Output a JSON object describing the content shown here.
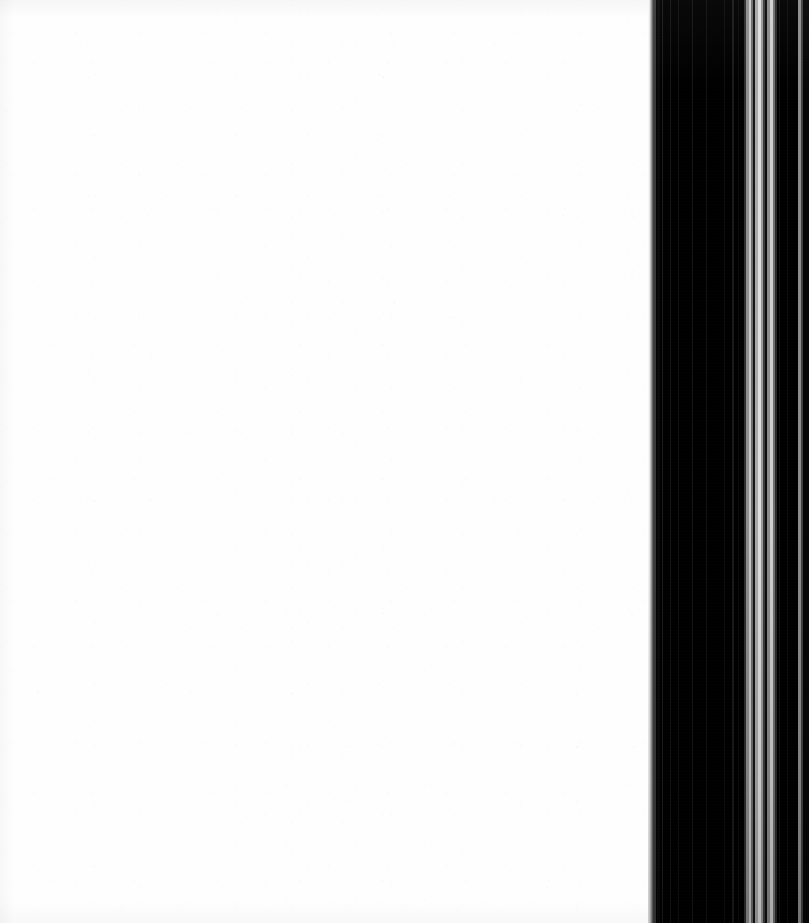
{
  "scan": {
    "width": 809,
    "height": 923,
    "background_color": "#ffffff"
  },
  "page_surface": {
    "label": "Blank scanned page",
    "left": 0,
    "width": 652,
    "paper_color": "#fefefe",
    "content_text": ""
  },
  "gutter": {
    "label": "Book gutter shadow band",
    "left": 648,
    "width": 161,
    "base_color": "#000000",
    "falloff": {
      "left": 0,
      "width": 9,
      "from_color": "#fdfdfd",
      "to_color": "#000000"
    },
    "stripes": [
      {
        "name": "gutter-stripe-1",
        "left": 6,
        "width": 2,
        "color": "#3a3a3a"
      },
      {
        "name": "gutter-stripe-2",
        "left": 9,
        "width": 3,
        "color": "#0a0a0a"
      },
      {
        "name": "gutter-stripe-3",
        "left": 14,
        "width": 1,
        "color": "#1c1c1c"
      },
      {
        "name": "gutter-stripe-4",
        "left": 22,
        "width": 1,
        "color": "#141414"
      },
      {
        "name": "gutter-stripe-5",
        "left": 30,
        "width": 1,
        "color": "#101010"
      },
      {
        "name": "gutter-stripe-6",
        "left": 44,
        "width": 1,
        "color": "#161616"
      },
      {
        "name": "gutter-stripe-7",
        "left": 58,
        "width": 1,
        "color": "#121212"
      },
      {
        "name": "gutter-stripe-8",
        "left": 76,
        "width": 1,
        "color": "#0e0e0e"
      },
      {
        "name": "gutter-stripe-9",
        "left": 84,
        "width": 2,
        "color": "#1a1a1a"
      },
      {
        "name": "gutter-stripe-10",
        "left": 90,
        "width": 1,
        "color": "#0c0c0c"
      },
      {
        "name": "gutter-highlight-a",
        "left": 96,
        "width": 2,
        "color": "#2e2e2e"
      },
      {
        "name": "gutter-highlight-b",
        "left": 98,
        "width": 3,
        "color": "#8f8f8f"
      },
      {
        "name": "gutter-highlight-c",
        "left": 101,
        "width": 2,
        "color": "#c8c8c8"
      },
      {
        "name": "gutter-highlight-d",
        "left": 103,
        "width": 2,
        "color": "#6e6e6e"
      },
      {
        "name": "gutter-highlight-e",
        "left": 105,
        "width": 2,
        "color": "#151515"
      },
      {
        "name": "gutter-highlight-f",
        "left": 107,
        "width": 3,
        "color": "#a8a8a8"
      },
      {
        "name": "gutter-highlight-g",
        "left": 110,
        "width": 3,
        "color": "#dedede"
      },
      {
        "name": "gutter-highlight-h",
        "left": 113,
        "width": 2,
        "color": "#9a9a9a"
      },
      {
        "name": "gutter-highlight-i",
        "left": 115,
        "width": 2,
        "color": "#3c3c3c"
      },
      {
        "name": "gutter-highlight-j",
        "left": 117,
        "width": 2,
        "color": "#0d0d0d"
      },
      {
        "name": "gutter-highlight-k",
        "left": 119,
        "width": 3,
        "color": "#8a8a8a"
      },
      {
        "name": "gutter-highlight-l",
        "left": 122,
        "width": 3,
        "color": "#cfcfcf"
      },
      {
        "name": "gutter-highlight-m",
        "left": 125,
        "width": 2,
        "color": "#707070"
      },
      {
        "name": "gutter-highlight-n",
        "left": 127,
        "width": 2,
        "color": "#2a2a2a"
      },
      {
        "name": "gutter-stripe-11",
        "left": 131,
        "width": 1,
        "color": "#141414"
      },
      {
        "name": "gutter-stripe-12",
        "left": 139,
        "width": 1,
        "color": "#0f0f0f"
      },
      {
        "name": "gutter-edge-line",
        "left": 150,
        "width": 3,
        "color": "#8d8d8d"
      },
      {
        "name": "gutter-edge-shade",
        "left": 153,
        "width": 2,
        "color": "#414141"
      },
      {
        "name": "gutter-edge-dark",
        "left": 155,
        "width": 6,
        "color": "#060606"
      }
    ]
  }
}
